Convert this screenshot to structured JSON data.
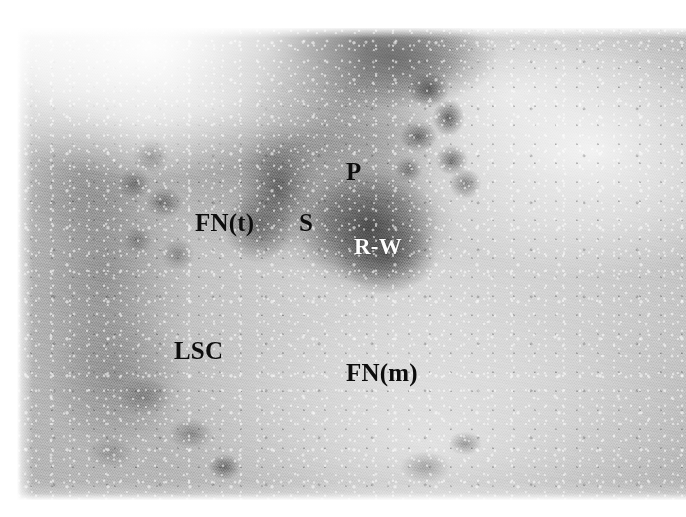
{
  "figure": {
    "kind": "anatomical-photograph",
    "background_color": "#ffffff",
    "label_dark_color": "#0d0d0d",
    "label_light_color": "#fdfdfd",
    "labels": [
      {
        "id": "p",
        "text": "P",
        "tone": "dark",
        "meaning": "promontory"
      },
      {
        "id": "fnt",
        "text": "FN(t)",
        "tone": "dark",
        "meaning": "facial nerve, tympanic segment"
      },
      {
        "id": "s",
        "text": "S",
        "tone": "dark",
        "meaning": "stapes"
      },
      {
        "id": "rw",
        "text": "R-W",
        "tone": "light",
        "meaning": "round window"
      },
      {
        "id": "lsc",
        "text": "LSC",
        "tone": "dark",
        "meaning": "lateral semicircular canal"
      },
      {
        "id": "fnm",
        "text": "FN(m)",
        "tone": "dark",
        "meaning": "facial nerve, mastoid segment"
      }
    ]
  }
}
